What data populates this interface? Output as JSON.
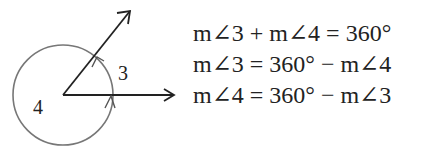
{
  "diagram": {
    "labels": {
      "angle3": "3",
      "angle4": "4"
    },
    "colors": {
      "circle": "#777777",
      "rays": "#222222"
    }
  },
  "equations": [
    "m∠3 + m∠4 = 360°",
    "m∠3 = 360° − m∠4",
    "m∠4 = 360° − m∠3"
  ]
}
